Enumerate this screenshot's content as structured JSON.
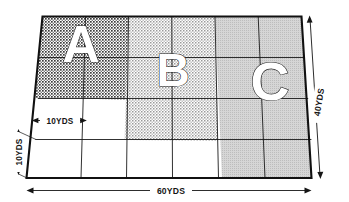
{
  "dimensions": {
    "width_label": "60YDS",
    "height_label": "40YDS",
    "cell_width_label": "10YDS",
    "cell_height_label": "10YDS",
    "grid_columns": 6,
    "grid_rows": 4,
    "cell_size_yards": 10,
    "total_width_yards": 60,
    "total_height_yards": 40
  },
  "regions": [
    {
      "letter": "A",
      "fill": "#4a4a4a",
      "pattern": "dense-checker",
      "columns": [
        1,
        2
      ],
      "rows": [
        1,
        2
      ],
      "area_yards2": 800
    },
    {
      "letter": "B",
      "fill": "#8a8a8a",
      "pattern": "medium-dots",
      "columns": [
        3,
        4
      ],
      "rows": [
        1,
        3
      ],
      "area_yards2": 1200
    },
    {
      "letter": "C",
      "fill": "#c9c9c9",
      "pattern": "light-gray",
      "columns": [
        5,
        6
      ],
      "rows": [
        1,
        4
      ],
      "area_yards2": 1600
    }
  ],
  "colors": {
    "line": "#111111",
    "grid_line": "#1a1a1a",
    "background": "#ffffff",
    "region_a": "#4a4a4a",
    "region_b": "#8a8a8a",
    "region_c": "#c9c9c9",
    "letter_fill": "#ffffff",
    "letter_stroke": "#202020"
  }
}
